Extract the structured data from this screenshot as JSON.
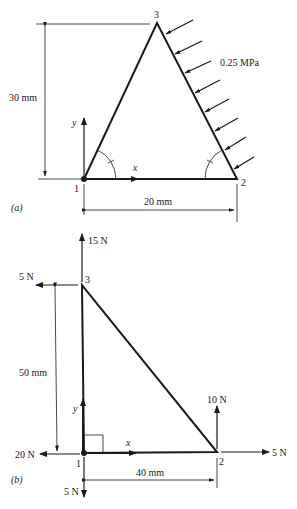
{
  "figure_a": {
    "label": "(a)",
    "nodes": [
      {
        "id": "1",
        "label": "1"
      },
      {
        "id": "2",
        "label": "2"
      },
      {
        "id": "3",
        "label": "3"
      }
    ],
    "axes": {
      "x": "x",
      "y": "y"
    },
    "dimensions": {
      "height": "30 mm",
      "base": "20 mm"
    },
    "load": {
      "pressure": "0.25 MPa",
      "arrow_count": 8
    }
  },
  "figure_b": {
    "label": "(b)",
    "nodes": [
      {
        "id": "1",
        "label": "1"
      },
      {
        "id": "2",
        "label": "2"
      },
      {
        "id": "3",
        "label": "3"
      }
    ],
    "axes": {
      "x": "x",
      "y": "y"
    },
    "dimensions": {
      "height": "50 mm",
      "base": "40 mm"
    },
    "forces": {
      "node3_up": "15 N",
      "node3_left": "5 N",
      "node2_up": "10 N",
      "node2_right": "5 N",
      "node1_left": "20 N",
      "node1_down": "5 N"
    }
  }
}
